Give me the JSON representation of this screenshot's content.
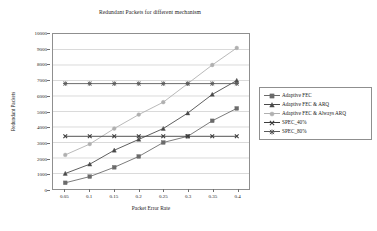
{
  "chart_data": {
    "type": "line",
    "title": "Redundant Packets for different mechanism",
    "xlabel": "Packet Error Rate",
    "ylabel": "Redundant Packets",
    "x": [
      0.05,
      0.1,
      0.15,
      0.2,
      0.25,
      0.3,
      0.35,
      0.4
    ],
    "x_tick_labels": [
      "0.05",
      "0.1",
      "0.15",
      "0.2",
      "0.25",
      "0.3",
      "0.35",
      "0.4"
    ],
    "y_tick_labels": [
      "0",
      "1000",
      "2000",
      "3000",
      "4000",
      "5000",
      "6000",
      "7000",
      "8000",
      "9000",
      "10000"
    ],
    "y_ticks": [
      0,
      1000,
      2000,
      3000,
      4000,
      5000,
      6000,
      7000,
      8000,
      9000,
      10000
    ],
    "ylim": [
      0,
      10000
    ],
    "xlim": [
      0.025,
      0.425
    ],
    "grid": "horizontal",
    "legend_position": "right",
    "series": [
      {
        "name": "Adaptive FEC",
        "marker": "square",
        "color": "#6b6b6b",
        "values": [
          400,
          800,
          1400,
          2100,
          3000,
          3400,
          4400,
          5200
        ]
      },
      {
        "name": "Adaptive FEC & ARQ",
        "marker": "triangle",
        "color": "#4a4a4a",
        "values": [
          1000,
          1600,
          2500,
          3200,
          3900,
          4900,
          6100,
          7000
        ]
      },
      {
        "name": "Adaptive FEC & Always ARQ",
        "marker": "circle",
        "color": "#b0b0b0",
        "values": [
          2200,
          2900,
          3900,
          4800,
          5600,
          6800,
          8000,
          9100
        ]
      },
      {
        "name": "SPEC_40%",
        "marker": "cross",
        "color": "#3d3d3d",
        "values": [
          3400,
          3400,
          3400,
          3400,
          3400,
          3400,
          3400,
          3400
        ]
      },
      {
        "name": "SPEC_80%",
        "marker": "asterisk",
        "color": "#5a5a5a",
        "values": [
          6800,
          6800,
          6800,
          6800,
          6800,
          6800,
          6800,
          6800
        ]
      }
    ]
  },
  "colors": {
    "frame": "#8f8f8f",
    "grid": "#c9c9c9",
    "text": "#1a1a1a",
    "background": "#ffffff"
  }
}
